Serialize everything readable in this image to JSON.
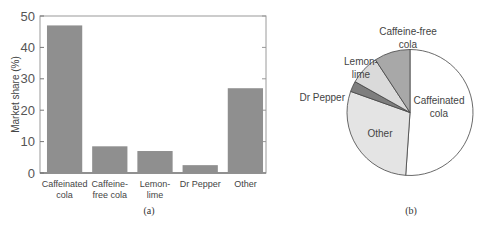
{
  "chart_data": [
    {
      "type": "bar",
      "caption": "(a)",
      "categories": [
        "Caffeinated cola",
        "Caffeine-free cola",
        "Lemon-lime",
        "Dr Pepper",
        "Other"
      ],
      "category_label_lines": [
        [
          "Caffeinated",
          "cola"
        ],
        [
          "Caffeine-",
          "free cola"
        ],
        [
          "Lemon-",
          "lime"
        ],
        [
          "Dr Pepper"
        ],
        [
          "Other"
        ]
      ],
      "values": [
        47,
        8.5,
        7,
        2.5,
        27
      ],
      "title": "",
      "xlabel": "",
      "ylabel": "Market share  (%)",
      "ylim": [
        0,
        50
      ],
      "yticks": [
        0,
        10,
        20,
        30,
        40,
        50
      ],
      "grid": false,
      "bar_color": "#8f8f8f"
    },
    {
      "type": "pie",
      "caption": "(b)",
      "labels": [
        "Caffeinated cola",
        "Other",
        "Dr Pepper",
        "Lemon-lime",
        "Caffeine-free cola"
      ],
      "label_lines": [
        [
          "Caffeinated",
          "cola"
        ],
        [
          "Other"
        ],
        [
          "Dr Pepper"
        ],
        [
          "Lemon-",
          "lime"
        ],
        [
          "Caffeine-free",
          "cola"
        ]
      ],
      "values": [
        47,
        27,
        2.5,
        7,
        8.5
      ],
      "colors": [
        "#ffffff",
        "#e4e4e4",
        "#7e7e7e",
        "#dadada",
        "#a8a8a8"
      ],
      "start": "top",
      "direction": "clockwise"
    }
  ]
}
